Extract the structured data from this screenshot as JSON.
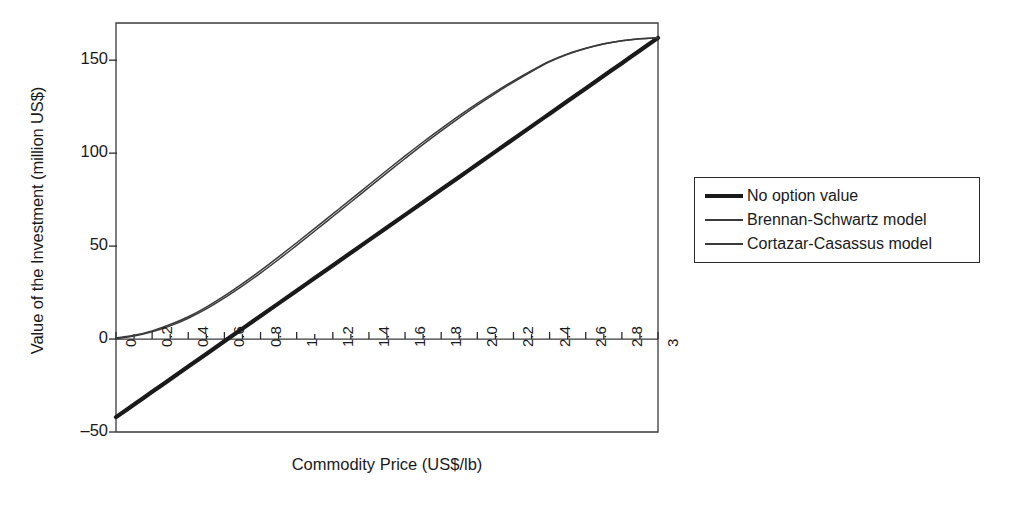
{
  "chart_data": {
    "type": "line",
    "title": "",
    "xlabel": "Commodity Price (US$/lb)",
    "ylabel": "Value of the Investment (million US$)",
    "xlim": [
      0,
      3
    ],
    "ylim": [
      -50,
      170
    ],
    "xticks": [
      "0",
      "0.2",
      "0.4",
      "0.6",
      "0.8",
      "1",
      "1.2",
      "1.4",
      "1.6",
      "1.8",
      "2.0",
      "2.2",
      "2.4",
      "2.6",
      "2.8",
      "3"
    ],
    "xtick_values": [
      0,
      0.2,
      0.4,
      0.6,
      0.8,
      1,
      1.2,
      1.4,
      1.6,
      1.8,
      2.0,
      2.2,
      2.4,
      2.6,
      2.8,
      3
    ],
    "minor_tick_step": 0.1,
    "yticks": [
      "150",
      "100",
      "50",
      "0",
      "-50"
    ],
    "ytick_values": [
      150,
      100,
      50,
      0,
      -50
    ],
    "grid": false,
    "legend_position": "right-outside",
    "x": [
      0,
      0.1,
      0.2,
      0.3,
      0.4,
      0.5,
      0.6,
      0.7,
      0.8,
      0.9,
      1.0,
      1.1,
      1.2,
      1.3,
      1.4,
      1.5,
      1.6,
      1.7,
      1.8,
      1.9,
      2.0,
      2.1,
      2.2,
      2.3,
      2.4,
      2.5,
      2.6,
      2.7,
      2.8,
      2.9,
      3.0
    ],
    "series": [
      {
        "name": "No option value",
        "style": "thick",
        "color": "#1a1a1a",
        "values": [
          -42,
          -35.2,
          -28.4,
          -21.6,
          -14.8,
          -8,
          -1.2,
          5.6,
          12.4,
          19.2,
          26,
          32.8,
          39.6,
          46.4,
          53.2,
          60,
          66.8,
          73.6,
          80.4,
          87.2,
          94,
          100.8,
          107.6,
          114.4,
          121.2,
          128,
          134.8,
          141.6,
          148.4,
          155.2,
          162
        ]
      },
      {
        "name": "Brennan-Schwartz model",
        "style": "thin",
        "color": "#3a3a3a",
        "values": [
          0.5,
          2.0,
          4.4,
          7.8,
          12.0,
          17.2,
          23.2,
          29.8,
          36.8,
          44.2,
          51.8,
          59.5,
          67.3,
          75.1,
          83.0,
          90.8,
          98.5,
          106.0,
          113.2,
          120.2,
          126.8,
          133.0,
          138.9,
          144.4,
          149.5,
          153.4,
          156.4,
          158.8,
          160.5,
          161.5,
          162.0
        ]
      },
      {
        "name": "Cortazar-Casassus model",
        "style": "thin",
        "color": "#3a3a3a",
        "values": [
          0.2,
          1.6,
          3.9,
          7.1,
          11.2,
          16.2,
          22.1,
          28.6,
          35.5,
          42.8,
          50.4,
          58.1,
          65.9,
          73.7,
          81.6,
          89.4,
          97.1,
          104.7,
          112.0,
          119.0,
          125.8,
          132.2,
          138.2,
          143.9,
          149.1,
          153.2,
          156.3,
          158.7,
          160.4,
          161.5,
          162.0
        ]
      }
    ]
  },
  "legend": {
    "items": [
      {
        "label": "No option value",
        "style": "thick"
      },
      {
        "label": "Brennan-Schwartz model",
        "style": "thin"
      },
      {
        "label": "Cortazar-Casassus model",
        "style": "thin"
      }
    ]
  }
}
